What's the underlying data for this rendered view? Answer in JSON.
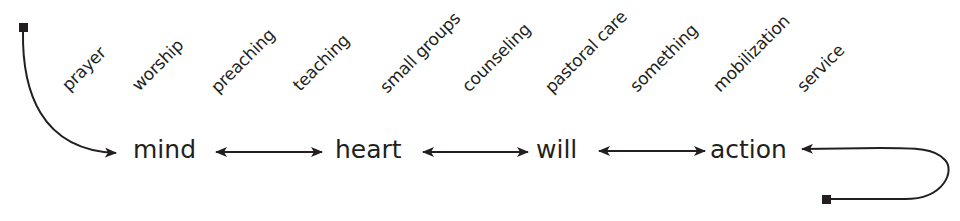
{
  "diagram": {
    "activities": [
      {
        "label": "prayer",
        "x": 71,
        "y": 94
      },
      {
        "label": "worship",
        "x": 141,
        "y": 94
      },
      {
        "label": "preaching",
        "x": 220,
        "y": 96
      },
      {
        "label": "teaching",
        "x": 302,
        "y": 94
      },
      {
        "label": "small groups",
        "x": 389,
        "y": 96
      },
      {
        "label": "counseling",
        "x": 471,
        "y": 95
      },
      {
        "label": "pastoral care",
        "x": 554,
        "y": 96
      },
      {
        "label": "something",
        "x": 639,
        "y": 95
      },
      {
        "label": "mobilization",
        "x": 722,
        "y": 95
      },
      {
        "label": "service",
        "x": 806,
        "y": 95
      }
    ],
    "nodes": [
      {
        "label": "mind",
        "x": 133
      },
      {
        "label": "heart",
        "x": 335
      },
      {
        "label": "will",
        "x": 536
      },
      {
        "label": "action",
        "x": 710
      }
    ],
    "colors": {
      "ink": "#231f20",
      "background": "#ffffff"
    }
  }
}
